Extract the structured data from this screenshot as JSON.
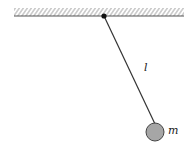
{
  "diagram": {
    "type": "pendulum",
    "labels": {
      "length": "l",
      "mass": "m"
    },
    "colors": {
      "line": "#333333",
      "hatch": "#999999",
      "bob_fill": "#a6a6a6",
      "bob_stroke": "#444444",
      "pivot": "#111111"
    }
  }
}
